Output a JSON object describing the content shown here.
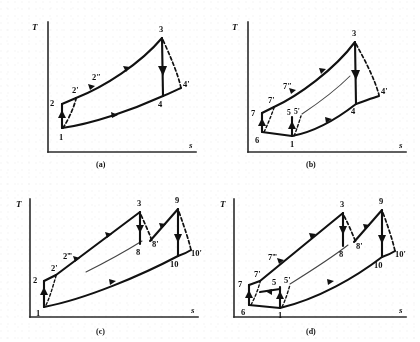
{
  "figure": {
    "panel_count": 4,
    "axis": {
      "y_label": "T",
      "x_label": "s"
    },
    "ink_color": "#111111",
    "background_color": "#ffffff"
  },
  "panels": [
    {
      "id": "a",
      "caption": "(a)",
      "y_axis_label": "T",
      "x_axis_label": "s",
      "description": "Simple Brayton cycle with irreversible compression and expansion",
      "points": [
        {
          "label": "1",
          "x": 62,
          "y": 128
        },
        {
          "label": "2",
          "x": 62,
          "y": 104
        },
        {
          "label": "2'",
          "x": 76,
          "y": 98
        },
        {
          "label": "2″",
          "x": 98,
          "y": 84
        },
        {
          "label": "3",
          "x": 162,
          "y": 38
        },
        {
          "label": "4",
          "x": 163,
          "y": 96
        },
        {
          "label": "4'",
          "x": 180,
          "y": 88
        }
      ],
      "label_positions": [
        {
          "label": "1",
          "x": 59,
          "y": 140
        },
        {
          "label": "2",
          "x": 52,
          "y": 105
        },
        {
          "label": "2'",
          "x": 74,
          "y": 92
        },
        {
          "label": "2″",
          "x": 95,
          "y": 79
        },
        {
          "label": "3",
          "x": 160,
          "y": 32
        },
        {
          "label": "4",
          "x": 160,
          "y": 106
        },
        {
          "label": "4'",
          "x": 182,
          "y": 86
        }
      ]
    },
    {
      "id": "b",
      "caption": "(b)",
      "y_axis_label": "T",
      "x_axis_label": "s",
      "description": "Regenerative cycle with intercooled compression",
      "points": [
        {
          "label": "6",
          "x": 52,
          "y": 132
        },
        {
          "label": "7",
          "x": 52,
          "y": 113
        },
        {
          "label": "7'",
          "x": 64,
          "y": 107
        },
        {
          "label": "7″",
          "x": 82,
          "y": 93
        },
        {
          "label": "1",
          "x": 82,
          "y": 136
        },
        {
          "label": "5",
          "x": 82,
          "y": 117
        },
        {
          "label": "5'",
          "x": 90,
          "y": 115
        },
        {
          "label": "3",
          "x": 145,
          "y": 42
        },
        {
          "label": "4",
          "x": 145,
          "y": 104
        },
        {
          "label": "4'",
          "x": 168,
          "y": 96
        }
      ],
      "label_positions": [
        {
          "label": "6",
          "x": 47,
          "y": 142
        },
        {
          "label": "7",
          "x": 44,
          "y": 115
        },
        {
          "label": "7'",
          "x": 60,
          "y": 102
        },
        {
          "label": "7″",
          "x": 76,
          "y": 88
        },
        {
          "label": "1",
          "x": 80,
          "y": 146
        },
        {
          "label": "5",
          "x": 79,
          "y": 114
        },
        {
          "label": "5'",
          "x": 87,
          "y": 113
        },
        {
          "label": "3",
          "x": 143,
          "y": 36
        },
        {
          "label": "4",
          "x": 143,
          "y": 113
        },
        {
          "label": "4'",
          "x": 170,
          "y": 95
        }
      ]
    },
    {
      "id": "c",
      "caption": "(c)",
      "y_axis_label": "T",
      "x_axis_label": "s",
      "description": "Cycle with reheat between two turbine stages",
      "points": [
        {
          "label": "1",
          "x": 44,
          "y": 136
        },
        {
          "label": "2",
          "x": 44,
          "y": 110
        },
        {
          "label": "2'",
          "x": 56,
          "y": 104
        },
        {
          "label": "2‴",
          "x": 74,
          "y": 91
        },
        {
          "label": "3",
          "x": 140,
          "y": 41
        },
        {
          "label": "8",
          "x": 140,
          "y": 73
        },
        {
          "label": "8'",
          "x": 152,
          "y": 70
        },
        {
          "label": "9",
          "x": 178,
          "y": 38
        },
        {
          "label": "10",
          "x": 178,
          "y": 85
        },
        {
          "label": "10'",
          "x": 190,
          "y": 79
        }
      ],
      "label_positions": [
        {
          "label": "1",
          "x": 38,
          "y": 144
        },
        {
          "label": "2",
          "x": 36,
          "y": 111
        },
        {
          "label": "2'",
          "x": 53,
          "y": 99
        },
        {
          "label": "2‴",
          "x": 67,
          "y": 87
        },
        {
          "label": "3",
          "x": 138,
          "y": 35
        },
        {
          "label": "8",
          "x": 137,
          "y": 83
        },
        {
          "label": "8'",
          "x": 152,
          "y": 75
        },
        {
          "label": "9",
          "x": 176,
          "y": 32
        },
        {
          "label": "10",
          "x": 172,
          "y": 95
        },
        {
          "label": "10'",
          "x": 190,
          "y": 84
        }
      ]
    },
    {
      "id": "d",
      "caption": "(d)",
      "y_axis_label": "T",
      "x_axis_label": "s",
      "description": "Reheat cycle with intercooling and regeneration",
      "points": [
        {
          "label": "6",
          "x": 39,
          "y": 134
        },
        {
          "label": "7",
          "x": 39,
          "y": 114
        },
        {
          "label": "7'",
          "x": 50,
          "y": 110
        },
        {
          "label": "7‴",
          "x": 70,
          "y": 92
        },
        {
          "label": "1",
          "x": 70,
          "y": 137
        },
        {
          "label": "5",
          "x": 70,
          "y": 116
        },
        {
          "label": "5'",
          "x": 80,
          "y": 113
        },
        {
          "label": "3",
          "x": 133,
          "y": 42
        },
        {
          "label": "8",
          "x": 133,
          "y": 75
        },
        {
          "label": "8'",
          "x": 146,
          "y": 71
        },
        {
          "label": "9",
          "x": 172,
          "y": 39
        },
        {
          "label": "10",
          "x": 172,
          "y": 86
        },
        {
          "label": "10'",
          "x": 184,
          "y": 80
        }
      ],
      "label_positions": [
        {
          "label": "6",
          "x": 33,
          "y": 143
        },
        {
          "label": "7",
          "x": 31,
          "y": 115
        },
        {
          "label": "7'",
          "x": 46,
          "y": 105
        },
        {
          "label": "7‴",
          "x": 62,
          "y": 88
        },
        {
          "label": "1",
          "x": 68,
          "y": 146
        },
        {
          "label": "5",
          "x": 64,
          "y": 113
        },
        {
          "label": "5'",
          "x": 76,
          "y": 111
        },
        {
          "label": "3",
          "x": 131,
          "y": 36
        },
        {
          "label": "8",
          "x": 130,
          "y": 85
        },
        {
          "label": "8'",
          "x": 146,
          "y": 77
        },
        {
          "label": "9",
          "x": 170,
          "y": 33
        },
        {
          "label": "10",
          "x": 166,
          "y": 96
        },
        {
          "label": "10'",
          "x": 184,
          "y": 85
        }
      ]
    }
  ]
}
